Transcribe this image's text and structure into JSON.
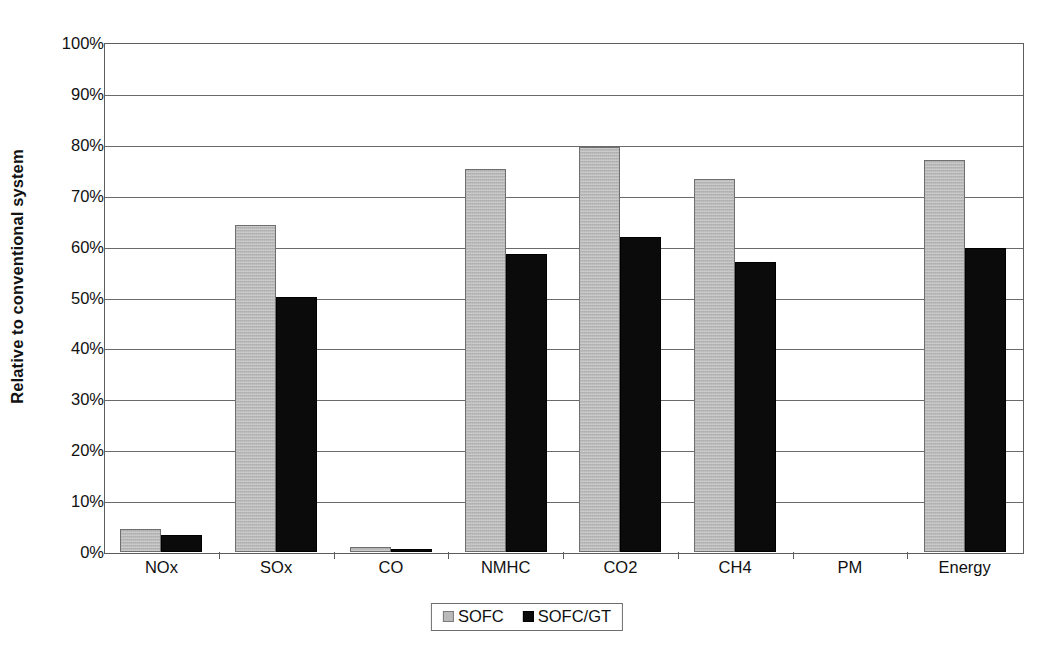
{
  "chart_data": {
    "type": "bar",
    "title": "",
    "xlabel": "",
    "ylabel": "Relative to conventional system",
    "categories": [
      "NOx",
      "SOx",
      "CO",
      "NMHC",
      "CO2",
      "CH4",
      "PM",
      "Energy"
    ],
    "series": [
      {
        "name": "SOFC",
        "color": "#b9b9b9",
        "values": [
          4.5,
          64.3,
          1.0,
          75.2,
          79.6,
          73.3,
          0.0,
          77.1
        ]
      },
      {
        "name": "SOFC/GT",
        "color": "#0b0b0b",
        "values": [
          3.3,
          50.1,
          0.5,
          58.5,
          61.8,
          57.0,
          0.0,
          59.8
        ]
      }
    ],
    "ylim": [
      0,
      100
    ],
    "ytick_values": [
      0,
      10,
      20,
      30,
      40,
      50,
      60,
      70,
      80,
      90,
      100
    ],
    "ytick_labels": [
      "0%",
      "10%",
      "20%",
      "30%",
      "40%",
      "50%",
      "60%",
      "70%",
      "80%",
      "90%",
      "100%"
    ],
    "grid": true,
    "legend_position": "bottom-center",
    "value_suffix": "%"
  },
  "legend": {
    "entries": [
      {
        "label": "SOFC",
        "swatch": "gray-square-swatch"
      },
      {
        "label": "SOFC/GT",
        "swatch": "black-square-swatch"
      }
    ]
  },
  "caption": {
    "fragment": ""
  }
}
